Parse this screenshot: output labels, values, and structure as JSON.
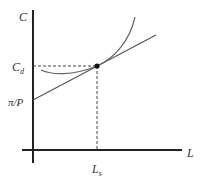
{
  "diagram": {
    "axes": {
      "y_label": "C",
      "x_label": "L"
    },
    "annotations": {
      "y_tick_cd": "C",
      "y_tick_cd_sub": "d",
      "y_tick_intercept": "π/P",
      "x_tick_ls": "L",
      "x_tick_ls_sub": "s"
    },
    "colors": {
      "axis": "#222222",
      "curve": "#666666",
      "line": "#555555",
      "dashed": "#444444",
      "point": "#111111"
    }
  }
}
